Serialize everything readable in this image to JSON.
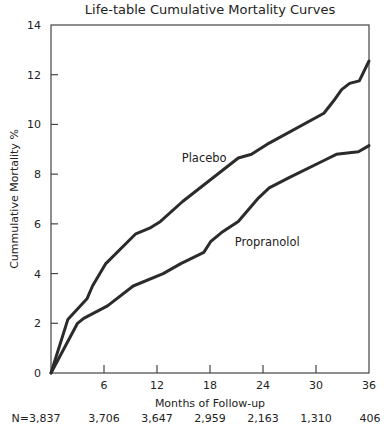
{
  "chart_data": {
    "type": "line",
    "title": "Life-table Cumulative Mortality Curves",
    "xlabel": "Months of Follow-up",
    "ylabel": "Cummulative Mortality %",
    "xlim": [
      0,
      36
    ],
    "ylim": [
      0,
      14
    ],
    "xticks": [
      6,
      12,
      18,
      24,
      30,
      36
    ],
    "yticks": [
      0,
      2,
      4,
      6,
      8,
      10,
      12,
      14
    ],
    "grid": false,
    "legend": "inline labels",
    "series": [
      {
        "name": "Placebo",
        "points": [
          [
            0,
            0
          ],
          [
            1.9,
            2.15
          ],
          [
            4.1,
            3.0
          ],
          [
            4.7,
            3.5
          ],
          [
            6.2,
            4.4
          ],
          [
            9.6,
            5.6
          ],
          [
            11.3,
            5.85
          ],
          [
            12.4,
            6.1
          ],
          [
            14.9,
            6.9
          ],
          [
            21.2,
            8.65
          ],
          [
            22.7,
            8.8
          ],
          [
            24.7,
            9.25
          ],
          [
            30.9,
            10.45
          ],
          [
            32,
            10.95
          ],
          [
            32.9,
            11.4
          ],
          [
            33.8,
            11.65
          ],
          [
            34.9,
            11.75
          ],
          [
            36,
            12.55
          ]
        ],
        "label_pos": [
          14.8,
          8.5
        ]
      },
      {
        "name": "Propranolol",
        "points": [
          [
            0,
            0
          ],
          [
            3.0,
            2.0
          ],
          [
            3.7,
            2.2
          ],
          [
            6.4,
            2.7
          ],
          [
            9.3,
            3.5
          ],
          [
            12.7,
            4.0
          ],
          [
            14.7,
            4.4
          ],
          [
            17.3,
            4.85
          ],
          [
            18.1,
            5.3
          ],
          [
            19.3,
            5.65
          ],
          [
            21.2,
            6.1
          ],
          [
            23.5,
            7.05
          ],
          [
            24.7,
            7.45
          ],
          [
            26.9,
            7.85
          ],
          [
            30.9,
            8.55
          ],
          [
            32.3,
            8.8
          ],
          [
            34.8,
            8.9
          ],
          [
            36,
            9.15
          ]
        ],
        "label_pos": [
          20.8,
          5.1
        ]
      }
    ],
    "at_risk": {
      "prefix": "N=",
      "months": [
        0,
        6,
        12,
        18,
        24,
        30,
        36
      ],
      "labels": [
        "N=3,837",
        "3,706",
        "3,647",
        "2,959",
        "2,163",
        "1,310",
        "406"
      ]
    }
  },
  "colors": {
    "line": "#2b2b2b",
    "axis": "#444444",
    "text": "#222222"
  }
}
